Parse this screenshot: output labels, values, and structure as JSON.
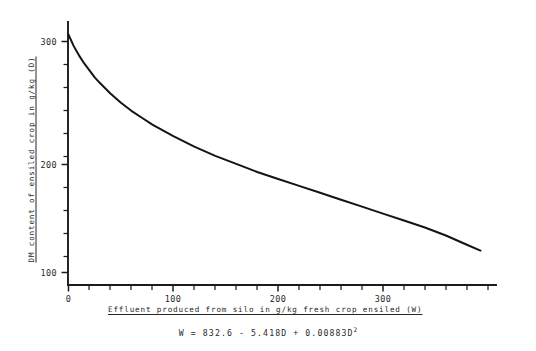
{
  "chart_data": {
    "type": "line",
    "title": "",
    "xlabel": "Effluent produced from silo in g/kg fresh crop ensiled (W)",
    "ylabel": "DM content of ensiled crop in g/kg (D)",
    "equation": "W = 832.6 - 5.418D + 0.00883D",
    "equation_exponent": "2",
    "xlim": [
      0,
      400
    ],
    "ylim": [
      92,
      322
    ],
    "grid": false,
    "legend": "none",
    "x_major_ticks": [
      0,
      100,
      200,
      300
    ],
    "x_major_tick_labels": [
      "0",
      "100",
      "200",
      "300"
    ],
    "x_minor_tick_step": 20,
    "y_major_ticks": [
      100,
      200,
      300
    ],
    "y_major_tick_labels": [
      "100",
      "200",
      "300"
    ],
    "y_minor_tick_step": 20,
    "series": [
      {
        "name": "D vs W",
        "x": [
          0,
          5,
          10,
          15,
          20,
          25,
          30,
          40,
          50,
          60,
          70,
          80,
          90,
          100,
          120,
          140,
          160,
          180,
          200,
          220,
          240,
          260,
          280,
          300,
          320,
          340,
          360,
          380,
          393
        ],
        "y": [
          306,
          296,
          288,
          281,
          275,
          269,
          264,
          255,
          247,
          240,
          234,
          228,
          223,
          218,
          209,
          201,
          194,
          187,
          181,
          175,
          169,
          163,
          157,
          151,
          145,
          139,
          132,
          124,
          119
        ]
      }
    ]
  },
  "figure": {
    "caption_equation_visible": true
  }
}
